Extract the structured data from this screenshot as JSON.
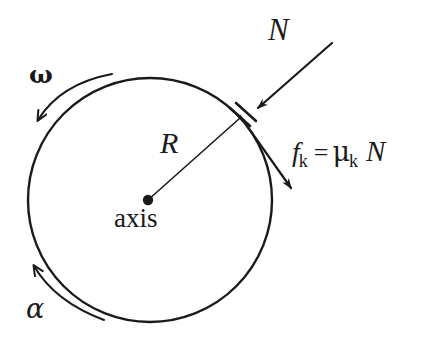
{
  "figure": {
    "stroke_color": "#1a1a1a",
    "background_color": "#ffffff",
    "width": 429,
    "height": 343
  },
  "disk": {
    "name": "rotating-disk",
    "center_x": 150,
    "center_y": 200,
    "radius": 122,
    "stroke_width": 2.4
  },
  "axis_point": {
    "label": "axis",
    "x": 148,
    "y": 200,
    "dot_radius": 5
  },
  "radius_line": {
    "label": "R",
    "from_x": 148,
    "from_y": 200,
    "to_x": 240,
    "to_y": 118,
    "stroke_width": 1.5
  },
  "contact_pad": {
    "name": "brake-pad",
    "x1": 232,
    "y1": 110,
    "x2": 252,
    "y2": 128
  },
  "normal_force": {
    "label": "N",
    "tail_x": 330,
    "tail_y": 45,
    "head_x": 253,
    "head_y": 112,
    "label_x": 268,
    "label_y": 14
  },
  "friction_force": {
    "equation_parts": {
      "symbol": "f",
      "symbol_subscript": "k",
      "equals": "=",
      "mu": "μ",
      "mu_subscript": "k",
      "normal": "N"
    },
    "equation_text": "f_k = μ_k N",
    "tail_x": 243,
    "tail_y": 118,
    "head_x": 293,
    "head_y": 192
  },
  "angular_velocity": {
    "label": "ω",
    "description": "angular velocity curved arrow, top-left, pointing down-left",
    "label_x": 29,
    "label_y": 62
  },
  "angular_acceleration": {
    "label": "α",
    "description": "angular acceleration curved arrow, bottom-left, pointing up-left",
    "label_x": 26,
    "label_y": 295
  }
}
